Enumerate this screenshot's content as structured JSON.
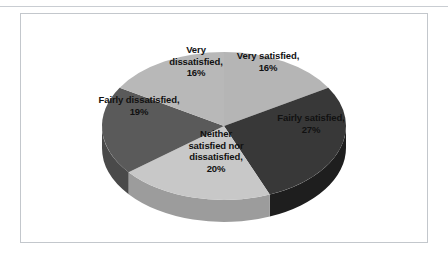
{
  "chart_data": {
    "type": "pie",
    "title": "",
    "subtitle": "",
    "xlabel": "",
    "ylabel": "",
    "grid": false,
    "legend_position": "none",
    "three_d": true,
    "data_labels": "category, percentage",
    "categories": [
      "Very satisfied",
      "Fairly satisfied",
      "Neither satisfied nor dissatisfied",
      "Fairly dissatisfied",
      "Very dissatisfied"
    ],
    "values": [
      16,
      27,
      20,
      19,
      16
    ],
    "units": "percent",
    "total": 98,
    "slices": [
      {
        "name": "Very satisfied",
        "value": 16,
        "label": "Very satisfied,\n16%",
        "color": "#b5b5b5",
        "side_color": "#8e8e8e"
      },
      {
        "name": "Fairly satisfied",
        "value": 27,
        "label": "Fairly satisfied,\n27%",
        "color": "#383838",
        "side_color": "#1e1e1e"
      },
      {
        "name": "Neither satisfied nor dissatisfied",
        "value": 20,
        "label": "Neither\nsatisfied nor\ndissatisfied,\n20%",
        "color": "#c8c8c8",
        "side_color": "#9c9c9c"
      },
      {
        "name": "Fairly dissatisfied",
        "value": 19,
        "label": "Fairly dissatisfied,\n19%",
        "color": "#5a5a5a",
        "side_color": "#4a4a4a"
      },
      {
        "name": "Very dissatisfied",
        "value": 16,
        "label": "Very\ndissatisfied,\n16%",
        "color": "#b8b8b8",
        "side_color": "#909090"
      }
    ],
    "colors": {
      "frame_border": "#c3c7cc",
      "page_rule": "#c9cdd2",
      "background": "#ffffff",
      "label_text": "#111111"
    }
  }
}
